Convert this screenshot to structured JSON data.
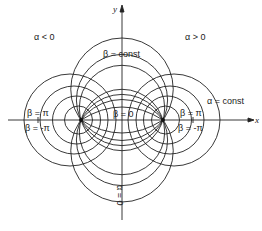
{
  "figure": {
    "axes": {
      "x_label": "x",
      "y_label": "y"
    },
    "region_labels": {
      "left": "α < 0",
      "right": "α > 0"
    },
    "curve_labels": {
      "beta_const": "β = const",
      "beta_zero": "β = 0",
      "alpha_const": "α = const",
      "alpha_zero": "α = 0",
      "left_beta_pi": "β = π",
      "left_beta_minus_pi": "β = -π",
      "right_beta_pi": "β = π",
      "right_beta_minus_pi": "β = -π"
    },
    "foci": {
      "left": [
        81,
        120
      ],
      "right": [
        163,
        120
      ]
    },
    "line_color": "#222222",
    "background": "#ffffff"
  }
}
